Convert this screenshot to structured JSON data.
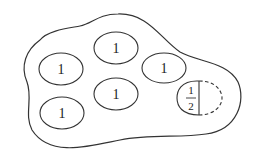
{
  "diagram": {
    "region": {
      "description": "irregular closed blob boundary"
    },
    "regions": [
      {
        "id": "e1",
        "label": "1",
        "cx": 61,
        "cy": 69,
        "rx": 22,
        "ry": 16
      },
      {
        "id": "e2",
        "label": "1",
        "cx": 116,
        "cy": 48,
        "rx": 22,
        "ry": 16
      },
      {
        "id": "e3",
        "label": "1",
        "cx": 164,
        "cy": 68,
        "rx": 22,
        "ry": 15
      },
      {
        "id": "e4",
        "label": "1",
        "cx": 116,
        "cy": 94,
        "rx": 22,
        "ry": 16
      },
      {
        "id": "e5",
        "label": "1",
        "cx": 62,
        "cy": 113,
        "rx": 22,
        "ry": 16
      }
    ],
    "half_region": {
      "numerator": "1",
      "denominator": "2",
      "solid_side": "left",
      "dashed_side": "right"
    },
    "colors": {
      "stroke": "#333333",
      "background": "#ffffff"
    }
  }
}
